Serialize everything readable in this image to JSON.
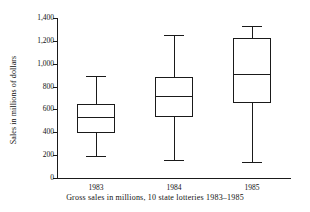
{
  "chart_data": {
    "type": "box",
    "title": "",
    "xlabel": "Gross sales in millions, 10 state lotteries 1983–1985",
    "ylabel": "Sales in millions of dollars",
    "categories": [
      "1983",
      "1984",
      "1985"
    ],
    "ylim": [
      0,
      1400
    ],
    "ytick_step": 200,
    "ytick_labels": [
      "0",
      "200",
      "400",
      "600",
      "800",
      "1,000",
      "1,200",
      "1,400"
    ],
    "ytick_values": [
      0,
      200,
      400,
      600,
      800,
      1000,
      1200,
      1400
    ],
    "grid": false,
    "legend": "none",
    "boxes": [
      {
        "category": "1983",
        "whisker_low": 190,
        "q1": 395,
        "median": 530,
        "q3": 645,
        "whisker_high": 890
      },
      {
        "category": "1984",
        "whisker_low": 160,
        "q1": 530,
        "median": 720,
        "q3": 885,
        "whisker_high": 1255
      },
      {
        "category": "1985",
        "whisker_low": 140,
        "q1": 660,
        "median": 910,
        "q3": 1225,
        "whisker_high": 1330
      }
    ],
    "colors": {
      "line": "#1a1a1a",
      "box_fill": "#ffffff",
      "background": "#ffffff"
    }
  }
}
